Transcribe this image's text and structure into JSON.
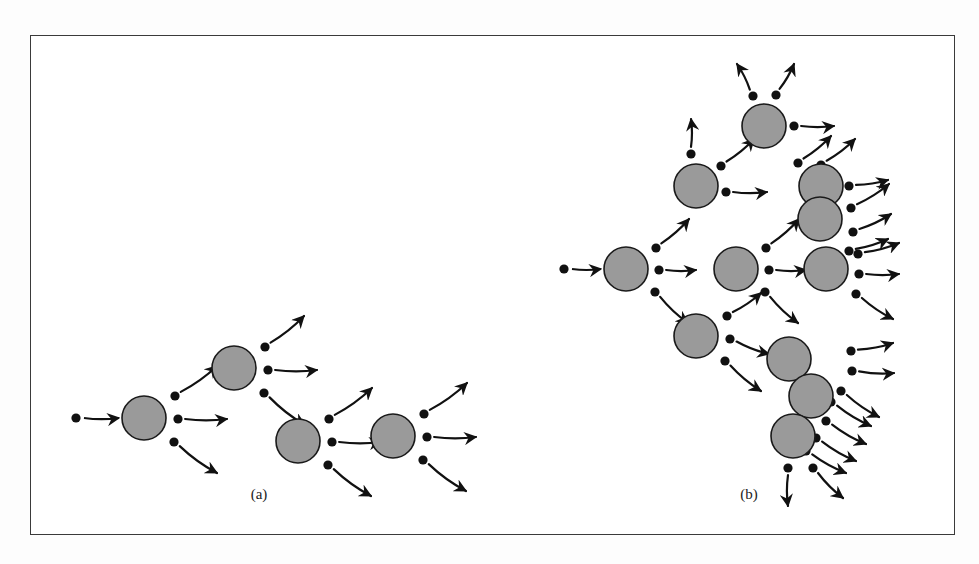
{
  "figure": {
    "frame": {
      "x": 30,
      "y": 35,
      "width": 925,
      "height": 500,
      "border_color": "#3a3a3a"
    },
    "style": {
      "node_fill": "#9a9a9a",
      "node_stroke": "#1a1a1a",
      "dot_fill": "#111111",
      "arrow_stroke": "#111111",
      "background": "#ffffff"
    },
    "panels": [
      {
        "id": "panel-a",
        "caption": "(a)",
        "caption_pos": {
          "x": 228,
          "y": 463
        },
        "description": "chain of four shaded nodes each emitting three arrows",
        "node_radius": 22,
        "dot_radius": 4.6,
        "nodes": [
          {
            "id": "a1",
            "cx": 113,
            "cy": 382
          },
          {
            "id": "a2",
            "cx": 203,
            "cy": 332
          },
          {
            "id": "a3",
            "cx": 267,
            "cy": 405
          },
          {
            "id": "a4",
            "cx": 362,
            "cy": 400
          }
        ],
        "incoming": [
          {
            "dot": {
              "x": 45,
              "y": 382
            },
            "to": {
              "x": 88,
              "y": 382
            }
          }
        ],
        "emissions": [
          {
            "from": "a1",
            "dot": {
              "x": 144,
              "y": 360
            },
            "tip": {
              "x": 186,
              "y": 330
            }
          },
          {
            "from": "a1",
            "dot": {
              "x": 147,
              "y": 383
            },
            "tip": {
              "x": 196,
              "y": 383
            }
          },
          {
            "from": "a1",
            "dot": {
              "x": 143,
              "y": 406
            },
            "tip": {
              "x": 186,
              "y": 437
            }
          },
          {
            "from": "a2",
            "dot": {
              "x": 234,
              "y": 311
            },
            "tip": {
              "x": 273,
              "y": 280
            }
          },
          {
            "from": "a2",
            "dot": {
              "x": 237,
              "y": 334
            },
            "tip": {
              "x": 286,
              "y": 334
            }
          },
          {
            "from": "a2",
            "dot": {
              "x": 233,
              "y": 357
            },
            "tip": {
              "x": 274,
              "y": 389
            }
          },
          {
            "from": "a3",
            "dot": {
              "x": 298,
              "y": 383
            },
            "tip": {
              "x": 341,
              "y": 352
            }
          },
          {
            "from": "a3",
            "dot": {
              "x": 301,
              "y": 406
            },
            "tip": {
              "x": 350,
              "y": 406
            }
          },
          {
            "from": "a3",
            "dot": {
              "x": 297,
              "y": 429
            },
            "tip": {
              "x": 340,
              "y": 460
            }
          },
          {
            "from": "a4",
            "dot": {
              "x": 393,
              "y": 378
            },
            "tip": {
              "x": 436,
              "y": 347
            }
          },
          {
            "from": "a4",
            "dot": {
              "x": 396,
              "y": 401
            },
            "tip": {
              "x": 445,
              "y": 401
            }
          },
          {
            "from": "a4",
            "dot": {
              "x": 392,
              "y": 424
            },
            "tip": {
              "x": 435,
              "y": 455
            }
          }
        ]
      },
      {
        "id": "panel-b",
        "caption": "(b)",
        "caption_pos": {
          "x": 718,
          "y": 463
        },
        "description": "branching cascade of shaded nodes growing to the right",
        "node_radius": 22,
        "dot_radius": 4.6,
        "nodes": [
          {
            "id": "b0",
            "cx": 595,
            "cy": 233
          },
          {
            "id": "b1",
            "cx": 665,
            "cy": 150
          },
          {
            "id": "b2",
            "cx": 665,
            "cy": 300
          },
          {
            "id": "b3",
            "cx": 733,
            "cy": 90
          },
          {
            "id": "b4",
            "cx": 705,
            "cy": 233
          },
          {
            "id": "b5",
            "cx": 758,
            "cy": 323
          },
          {
            "id": "b6",
            "cx": 790,
            "cy": 150
          },
          {
            "id": "b7",
            "cx": 789,
            "cy": 183
          },
          {
            "id": "b8",
            "cx": 795,
            "cy": 233
          },
          {
            "id": "b9",
            "cx": 780,
            "cy": 360
          },
          {
            "id": "b10",
            "cx": 762,
            "cy": 400
          }
        ],
        "incoming": [
          {
            "dot": {
              "x": 533,
              "y": 233
            },
            "to": {
              "x": 570,
              "y": 233
            }
          }
        ],
        "emissions": [
          {
            "from": "b0",
            "dot": {
              "x": 625,
              "y": 212
            },
            "tip": {
              "x": 658,
              "y": 183
            }
          },
          {
            "from": "b0",
            "dot": {
              "x": 628,
              "y": 234
            },
            "tip": {
              "x": 665,
              "y": 234
            }
          },
          {
            "from": "b0",
            "dot": {
              "x": 624,
              "y": 256
            },
            "tip": {
              "x": 657,
              "y": 287
            }
          },
          {
            "from": "b1",
            "dot": {
              "x": 660,
              "y": 118
            },
            "tip": {
              "x": 660,
              "y": 83
            }
          },
          {
            "from": "b1",
            "dot": {
              "x": 690,
              "y": 130
            },
            "tip": {
              "x": 723,
              "y": 103
            }
          },
          {
            "from": "b1",
            "dot": {
              "x": 695,
              "y": 156
            },
            "tip": {
              "x": 736,
              "y": 156
            }
          },
          {
            "from": "b3",
            "dot": {
              "x": 722,
              "y": 60
            },
            "tip": {
              "x": 706,
              "y": 28
            }
          },
          {
            "from": "b3",
            "dot": {
              "x": 745,
              "y": 59
            },
            "tip": {
              "x": 763,
              "y": 28
            }
          },
          {
            "from": "b3",
            "dot": {
              "x": 763,
              "y": 90
            },
            "tip": {
              "x": 803,
              "y": 90
            }
          },
          {
            "from": "b6",
            "dot": {
              "x": 767,
              "y": 127
            },
            "tip": {
              "x": 800,
              "y": 100
            }
          },
          {
            "from": "b6",
            "dot": {
              "x": 790,
              "y": 129
            },
            "tip": {
              "x": 824,
              "y": 103
            }
          },
          {
            "from": "b6",
            "dot": {
              "x": 818,
              "y": 150
            },
            "tip": {
              "x": 857,
              "y": 144
            }
          },
          {
            "from": "b4",
            "dot": {
              "x": 735,
              "y": 212
            },
            "tip": {
              "x": 768,
              "y": 183
            }
          },
          {
            "from": "b4",
            "dot": {
              "x": 738,
              "y": 234
            },
            "tip": {
              "x": 775,
              "y": 234
            }
          },
          {
            "from": "b4",
            "dot": {
              "x": 734,
              "y": 256
            },
            "tip": {
              "x": 767,
              "y": 287
            }
          },
          {
            "from": "b7",
            "dot": {
              "x": 820,
              "y": 172
            },
            "tip": {
              "x": 858,
              "y": 148
            }
          },
          {
            "from": "b7",
            "dot": {
              "x": 822,
              "y": 196
            },
            "tip": {
              "x": 860,
              "y": 178
            }
          },
          {
            "from": "b7",
            "dot": {
              "x": 818,
              "y": 215
            },
            "tip": {
              "x": 857,
              "y": 203
            }
          },
          {
            "from": "b8",
            "dot": {
              "x": 827,
              "y": 218
            },
            "tip": {
              "x": 868,
              "y": 207
            }
          },
          {
            "from": "b8",
            "dot": {
              "x": 828,
              "y": 238
            },
            "tip": {
              "x": 868,
              "y": 238
            }
          },
          {
            "from": "b8",
            "dot": {
              "x": 825,
              "y": 258
            },
            "tip": {
              "x": 862,
              "y": 283
            }
          },
          {
            "from": "b2",
            "dot": {
              "x": 696,
              "y": 280
            },
            "tip": {
              "x": 730,
              "y": 257
            }
          },
          {
            "from": "b2",
            "dot": {
              "x": 699,
              "y": 303
            },
            "tip": {
              "x": 738,
              "y": 318
            }
          },
          {
            "from": "b2",
            "dot": {
              "x": 694,
              "y": 325
            },
            "tip": {
              "x": 730,
              "y": 355
            }
          },
          {
            "from": "b5",
            "dot": {
              "x": 820,
              "y": 315
            },
            "tip": {
              "x": 862,
              "y": 307
            }
          },
          {
            "from": "b5",
            "dot": {
              "x": 821,
              "y": 335
            },
            "tip": {
              "x": 863,
              "y": 337
            }
          },
          {
            "from": "b5",
            "dot": {
              "x": 810,
              "y": 355
            },
            "tip": {
              "x": 848,
              "y": 381
            }
          },
          {
            "from": "b9",
            "dot": {
              "x": 800,
              "y": 366
            },
            "tip": {
              "x": 840,
              "y": 390
            }
          },
          {
            "from": "b9",
            "dot": {
              "x": 795,
              "y": 385
            },
            "tip": {
              "x": 835,
              "y": 408
            }
          },
          {
            "from": "b9",
            "dot": {
              "x": 785,
              "y": 402
            },
            "tip": {
              "x": 825,
              "y": 425
            }
          },
          {
            "from": "b10",
            "dot": {
              "x": 775,
              "y": 415
            },
            "tip": {
              "x": 815,
              "y": 437
            }
          },
          {
            "from": "b10",
            "dot": {
              "x": 757,
              "y": 432
            },
            "tip": {
              "x": 757,
              "y": 470
            }
          },
          {
            "from": "b10",
            "dot": {
              "x": 782,
              "y": 432
            },
            "tip": {
              "x": 812,
              "y": 462
            }
          }
        ]
      }
    ]
  }
}
